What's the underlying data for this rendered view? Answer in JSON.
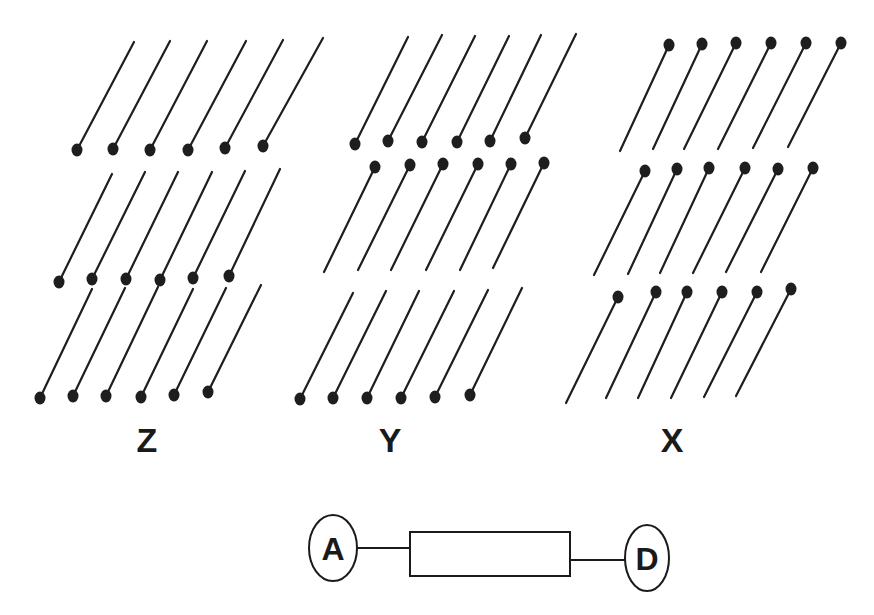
{
  "colors": {
    "ink": "#1e1e1e",
    "background": "#ffffff"
  },
  "groups": [
    {
      "label": "Z",
      "label_pos": [
        147,
        452
      ],
      "rows": [
        {
          "dot_end": "bottom",
          "pins": [
            {
              "dot": [
                77,
                150
              ],
              "end": [
                134,
                42
              ]
            },
            {
              "dot": [
                113,
                149
              ],
              "end": [
                170,
                41
              ]
            },
            {
              "dot": [
                150,
                150
              ],
              "end": [
                207,
                41
              ]
            },
            {
              "dot": [
                188,
                150
              ],
              "end": [
                246,
                41
              ]
            },
            {
              "dot": [
                225,
                148
              ],
              "end": [
                283,
                40
              ]
            },
            {
              "dot": [
                263,
                146
              ],
              "end": [
                323,
                38
              ]
            }
          ]
        },
        {
          "dot_end": "bottom",
          "pins": [
            {
              "dot": [
                59,
                282
              ],
              "end": [
                112,
                174
              ]
            },
            {
              "dot": [
                92,
                279
              ],
              "end": [
                145,
                172
              ]
            },
            {
              "dot": [
                126,
                279
              ],
              "end": [
                178,
                172
              ]
            },
            {
              "dot": [
                160,
                280
              ],
              "end": [
                212,
                172
              ]
            },
            {
              "dot": [
                193,
                278
              ],
              "end": [
                245,
                171
              ]
            },
            {
              "dot": [
                229,
                276
              ],
              "end": [
                280,
                169
              ]
            }
          ]
        },
        {
          "dot_end": "bottom",
          "pins": [
            {
              "dot": [
                40,
                398
              ],
              "end": [
                92,
                289
              ]
            },
            {
              "dot": [
                73,
                396
              ],
              "end": [
                125,
                288
              ]
            },
            {
              "dot": [
                106,
                396
              ],
              "end": [
                158,
                287
              ]
            },
            {
              "dot": [
                141,
                397
              ],
              "end": [
                193,
                289
              ]
            },
            {
              "dot": [
                174,
                395
              ],
              "end": [
                226,
                288
              ]
            },
            {
              "dot": [
                208,
                392
              ],
              "end": [
                261,
                285
              ]
            }
          ]
        }
      ]
    },
    {
      "label": "Y",
      "label_pos": [
        390,
        452
      ],
      "rows": [
        {
          "dot_end": "bottom",
          "pins": [
            {
              "dot": [
                355,
                144
              ],
              "end": [
                408,
                37
              ]
            },
            {
              "dot": [
                388,
                141
              ],
              "end": [
                442,
                35
              ]
            },
            {
              "dot": [
                422,
                142
              ],
              "end": [
                475,
                36
              ]
            },
            {
              "dot": [
                457,
                142
              ],
              "end": [
                509,
                36
              ]
            },
            {
              "dot": [
                490,
                141
              ],
              "end": [
                541,
                35
              ]
            },
            {
              "dot": [
                525,
                138
              ],
              "end": [
                576,
                34
              ]
            }
          ]
        },
        {
          "dot_end": "top",
          "pins": [
            {
              "dot": [
                375,
                167
              ],
              "end": [
                324,
                272
              ]
            },
            {
              "dot": [
                410,
                165
              ],
              "end": [
                358,
                270
              ]
            },
            {
              "dot": [
                443,
                164
              ],
              "end": [
                391,
                270
              ]
            },
            {
              "dot": [
                478,
                164
              ],
              "end": [
                426,
                270
              ]
            },
            {
              "dot": [
                511,
                164
              ],
              "end": [
                460,
                270
              ]
            },
            {
              "dot": [
                544,
                163
              ],
              "end": [
                493,
                268
              ]
            }
          ]
        },
        {
          "dot_end": "bottom",
          "pins": [
            {
              "dot": [
                300,
                399
              ],
              "end": [
                353,
                293
              ]
            },
            {
              "dot": [
                333,
                398
              ],
              "end": [
                386,
                291
              ]
            },
            {
              "dot": [
                367,
                398
              ],
              "end": [
                419,
                291
              ]
            },
            {
              "dot": [
                401,
                398
              ],
              "end": [
                454,
                291
              ]
            },
            {
              "dot": [
                435,
                397
              ],
              "end": [
                488,
                290
              ]
            },
            {
              "dot": [
                470,
                395
              ],
              "end": [
                522,
                288
              ]
            }
          ]
        }
      ]
    },
    {
      "label": "X",
      "label_pos": [
        672,
        452
      ],
      "rows": [
        {
          "dot_end": "top",
          "pins": [
            {
              "dot": [
                669,
                45
              ],
              "end": [
                620,
                151
              ]
            },
            {
              "dot": [
                702,
                44
              ],
              "end": [
                653,
                149
              ]
            },
            {
              "dot": [
                736,
                43
              ],
              "end": [
                684,
                149
              ]
            },
            {
              "dot": [
                771,
                43
              ],
              "end": [
                718,
                149
              ]
            },
            {
              "dot": [
                806,
                43
              ],
              "end": [
                753,
                148
              ]
            },
            {
              "dot": [
                841,
                43
              ],
              "end": [
                788,
                147
              ]
            }
          ]
        },
        {
          "dot_end": "top",
          "pins": [
            {
              "dot": [
                645,
                171
              ],
              "end": [
                594,
                275
              ]
            },
            {
              "dot": [
                677,
                169
              ],
              "end": [
                628,
                274
              ]
            },
            {
              "dot": [
                709,
                168
              ],
              "end": [
                660,
                273
              ]
            },
            {
              "dot": [
                745,
                168
              ],
              "end": [
                693,
                273
              ]
            },
            {
              "dot": [
                778,
                169
              ],
              "end": [
                726,
                272
              ]
            },
            {
              "dot": [
                813,
                168
              ],
              "end": [
                761,
                272
              ]
            }
          ]
        },
        {
          "dot_end": "top",
          "pins": [
            {
              "dot": [
                618,
                297
              ],
              "end": [
                566,
                403
              ]
            },
            {
              "dot": [
                656,
                292
              ],
              "end": [
                606,
                398
              ]
            },
            {
              "dot": [
                687,
                292
              ],
              "end": [
                638,
                398
              ]
            },
            {
              "dot": [
                722,
                292
              ],
              "end": [
                671,
                398
              ]
            },
            {
              "dot": [
                757,
                292
              ],
              "end": [
                704,
                397
              ]
            },
            {
              "dot": [
                791,
                289
              ],
              "end": [
                736,
                396
              ]
            }
          ]
        }
      ]
    }
  ],
  "chain": {
    "start_node": {
      "label": "A",
      "cx": 333,
      "cy": 548,
      "rx": 24,
      "ry": 33
    },
    "box": {
      "x": 410,
      "y": 532,
      "w": 160,
      "h": 44,
      "label": ""
    },
    "end_node": {
      "label": "D",
      "cx": 647,
      "cy": 558,
      "rx": 22,
      "ry": 33
    },
    "links": [
      {
        "x1": 357,
        "y1": 548,
        "x2": 410,
        "y2": 548
      },
      {
        "x1": 570,
        "y1": 560,
        "x2": 625,
        "y2": 560
      }
    ]
  }
}
